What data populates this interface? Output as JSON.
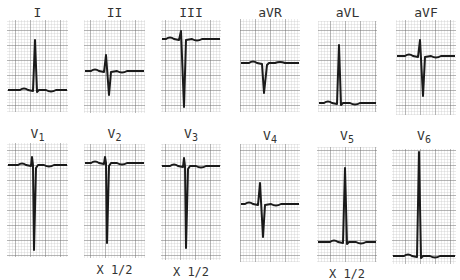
{
  "figure": {
    "grid": {
      "minor_px": 3,
      "major_px": 15,
      "minor_color": "#b8b8b8",
      "major_color": "#555555",
      "trace_color": "#1a1a1a"
    },
    "leads": [
      {
        "id": "I",
        "name": "I",
        "sub": "",
        "scale": "",
        "box": [
          7,
          20,
          61,
          92
        ],
        "label_y": 6,
        "baseline": 90,
        "shape": "tallR",
        "qrs_x": 36,
        "peak": 40,
        "trough": 90
      },
      {
        "id": "II",
        "name": "II",
        "sub": "",
        "scale": "",
        "box": [
          84,
          20,
          61,
          93
        ],
        "label_y": 6,
        "baseline": 71,
        "shape": "rS",
        "qrs_x": 107,
        "peak": 55,
        "trough": 95
      },
      {
        "id": "III",
        "name": "III",
        "sub": "",
        "scale": "",
        "box": [
          161,
          20,
          60,
          92
        ],
        "label_y": 6,
        "baseline": 39,
        "shape": "rS",
        "qrs_x": 182,
        "peak": 31,
        "trough": 107
      },
      {
        "id": "aVR",
        "name": "aVR",
        "sub": "",
        "scale": "",
        "box": [
          240,
          19,
          60,
          93
        ],
        "label_y": 6,
        "baseline": 63,
        "shape": "Q",
        "qrs_x": 265,
        "peak": 63,
        "trough": 93
      },
      {
        "id": "aVL",
        "name": "aVL",
        "sub": "",
        "scale": "",
        "box": [
          318,
          21,
          59,
          91
        ],
        "label_y": 6,
        "baseline": 103,
        "shape": "tallR",
        "qrs_x": 340,
        "peak": 45,
        "trough": 103
      },
      {
        "id": "aVF",
        "name": "aVF",
        "sub": "",
        "scale": "",
        "box": [
          396,
          20,
          60,
          95
        ],
        "label_y": 6,
        "baseline": 56,
        "shape": "rS",
        "qrs_x": 421,
        "peak": 40,
        "trough": 96
      },
      {
        "id": "V1",
        "name": "V",
        "sub": "1",
        "scale": "",
        "box": [
          7,
          143,
          61,
          114
        ],
        "label_y": 127,
        "baseline": 165,
        "shape": "QS",
        "qrs_x": 34,
        "peak": 157,
        "trough": 250
      },
      {
        "id": "V2",
        "name": "V",
        "sub": "2",
        "scale": "X 1/2",
        "box": [
          84,
          144,
          61,
          114
        ],
        "label_y": 127,
        "baseline": 163,
        "shape": "QS",
        "qrs_x": 107,
        "peak": 157,
        "trough": 243
      },
      {
        "id": "V3",
        "name": "V",
        "sub": "3",
        "scale": "X 1/2",
        "box": [
          161,
          144,
          60,
          116
        ],
        "label_y": 127,
        "baseline": 166,
        "shape": "QS",
        "qrs_x": 186,
        "peak": 158,
        "trough": 248
      },
      {
        "id": "V4",
        "name": "V",
        "sub": "4",
        "scale": "",
        "box": [
          240,
          144,
          60,
          118
        ],
        "label_y": 129,
        "baseline": 204,
        "shape": "rS",
        "qrs_x": 261,
        "peak": 183,
        "trough": 237
      },
      {
        "id": "V5",
        "name": "V",
        "sub": "5",
        "scale": "X 1/2",
        "box": [
          317,
          147,
          60,
          115
        ],
        "label_y": 129,
        "baseline": 242,
        "shape": "tallR",
        "qrs_x": 346,
        "peak": 168,
        "trough": 246
      },
      {
        "id": "V6",
        "name": "V",
        "sub": "6",
        "scale": "",
        "box": [
          392,
          149,
          64,
          115
        ],
        "label_y": 129,
        "baseline": 256,
        "shape": "tallR",
        "qrs_x": 420,
        "peak": 152,
        "trough": 256
      }
    ]
  }
}
